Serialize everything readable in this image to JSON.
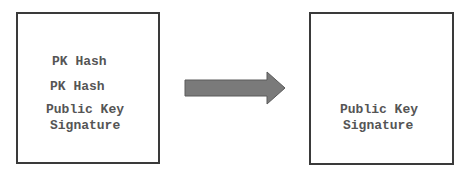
{
  "diagram": {
    "left_box": {
      "lines": [
        "PK Hash",
        "PK Hash",
        "Public Key",
        "Signature"
      ]
    },
    "right_box": {
      "lines": [
        "Public Key",
        "Signature"
      ]
    },
    "arrow": {
      "direction": "right",
      "color": "#7a7a7a"
    }
  }
}
